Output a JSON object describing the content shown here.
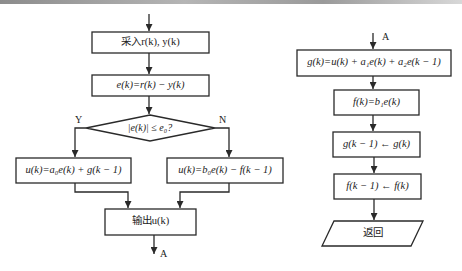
{
  "diagram": {
    "type": "flowchart",
    "left_flow": {
      "steps": [
        {
          "id": "input",
          "shape": "rect",
          "label": "采入r(k), y(k)"
        },
        {
          "id": "error",
          "shape": "rect",
          "label": "e(k)=r(k) − y(k)"
        },
        {
          "id": "decision",
          "shape": "diamond",
          "label": "|e(k)| ≤ e₀?"
        },
        {
          "id": "branch_yes",
          "shape": "rect",
          "label": "u(k)=a₀e(k) + g(k − 1)"
        },
        {
          "id": "branch_no",
          "shape": "rect",
          "label": "u(k)=b₀e(k) − f(k − 1)"
        },
        {
          "id": "output",
          "shape": "rect",
          "label": "输出u(k)"
        }
      ],
      "yes_label": "Y",
      "no_label": "N",
      "connector_out": "A"
    },
    "right_flow": {
      "connector_in": "A",
      "steps": [
        {
          "id": "update_g",
          "shape": "rect",
          "label": "g(k)=u(k) + a₁e(k) + a₂e(k − 1)"
        },
        {
          "id": "update_f",
          "shape": "rect",
          "label": "f(k)=b₁e(k)"
        },
        {
          "id": "shift_g",
          "shape": "rect",
          "label": "g(k − 1) ← g(k)"
        },
        {
          "id": "shift_f",
          "shape": "rect",
          "label": "f(k − 1) ← f(k)"
        },
        {
          "id": "return",
          "shape": "parallelogram",
          "label": "返回"
        }
      ]
    },
    "colors": {
      "stroke": "#2a2a2a",
      "text": "#222222",
      "background": "#ffffff"
    }
  }
}
